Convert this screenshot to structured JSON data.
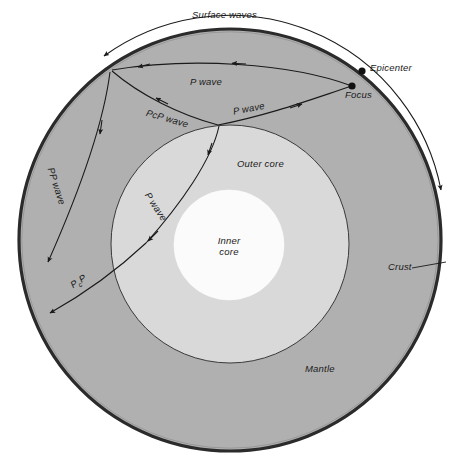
{
  "figure": {
    "title_visible": false,
    "background_color": "#ffffff"
  },
  "colors": {
    "mantle": "#b0b0b0",
    "outer_core": "#d9d9d9",
    "inner_core": "#fbfbfb",
    "crust_line": "#2b2b2b",
    "ray_line": "#1a1a1a",
    "text": "#1a1a1a"
  },
  "layers": [
    {
      "id": "crust",
      "label": "Crust"
    },
    {
      "id": "mantle",
      "label": "Mantle"
    },
    {
      "id": "outer_core",
      "label": "Outer core"
    },
    {
      "id": "inner_core",
      "label_line1": "Inner",
      "label_line2": "core"
    }
  ],
  "points": [
    {
      "id": "epicenter",
      "label": "Epicenter"
    },
    {
      "id": "focus",
      "label": "Focus"
    }
  ],
  "waves": [
    {
      "id": "surface-waves",
      "label": "Surface waves"
    },
    {
      "id": "p-wave-upper",
      "label": "P wave"
    },
    {
      "id": "p-wave-right",
      "label": "P wave"
    },
    {
      "id": "pcp-wave",
      "label": "PcP wave"
    },
    {
      "id": "pp-wave",
      "label": "PP wave"
    },
    {
      "id": "p-wave-core",
      "label": "P wave"
    },
    {
      "id": "pcp-lower",
      "label_main": "P",
      "label_sub": "c",
      "label_tail": "P"
    }
  ]
}
